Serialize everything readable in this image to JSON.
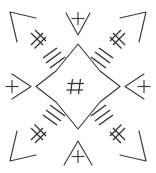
{
  "figure": {
    "width": 156,
    "height": 173,
    "background_color": "#ffffff",
    "ink_color": "#3a3a3f",
    "symmetry": "4-fold radial with diagonal and axial arms"
  },
  "center": {
    "name": "center-hash-in-star",
    "glyph": "#",
    "glyph_name": "hash-glyph",
    "enclosure": "concave-four-point-star",
    "cx": 78,
    "cy": 86.5,
    "star_point_radius": 42,
    "star_waist_radius": 26
  },
  "axial_arms": [
    {
      "name": "arm-top",
      "direction": "up",
      "chevron": "v-chevron-down",
      "glyph": "+",
      "glyph_name": "plus-glyph",
      "angle_deg": 270
    },
    {
      "name": "arm-right",
      "direction": "right",
      "chevron": "v-chevron-left",
      "glyph": "+",
      "glyph_name": "plus-glyph",
      "angle_deg": 0
    },
    {
      "name": "arm-bottom",
      "direction": "down",
      "chevron": "v-chevron-up",
      "glyph": "+",
      "glyph_name": "plus-glyph",
      "angle_deg": 90
    },
    {
      "name": "arm-left",
      "direction": "left",
      "chevron": "v-chevron-right",
      "glyph": "+",
      "glyph_name": "plus-glyph",
      "angle_deg": 180
    }
  ],
  "diagonal_arms": [
    {
      "name": "arm-top-left",
      "direction": "up-left",
      "corner_shape": "acute-arrowhead",
      "glyph": "rotated-hash",
      "glyph_name": "rotated-hash-glyph",
      "hatch_count": 3,
      "angle_deg": 225
    },
    {
      "name": "arm-top-right",
      "direction": "up-right",
      "corner_shape": "acute-arrowhead",
      "glyph": "rotated-hash",
      "glyph_name": "rotated-hash-glyph",
      "hatch_count": 3,
      "angle_deg": 315
    },
    {
      "name": "arm-bottom-right",
      "direction": "down-right",
      "corner_shape": "acute-arrowhead",
      "glyph": "rotated-hash",
      "glyph_name": "rotated-hash-glyph",
      "hatch_count": 3,
      "angle_deg": 45
    },
    {
      "name": "arm-bottom-left",
      "direction": "down-left",
      "corner_shape": "acute-arrowhead",
      "glyph": "rotated-hash",
      "glyph_name": "rotated-hash-glyph",
      "hatch_count": 3,
      "angle_deg": 135
    }
  ],
  "legend": {
    "plus_count": 4,
    "rotated_hash_count": 4,
    "hatch_group_count": 4,
    "arrowhead_count": 4,
    "center_hash_count": 1
  }
}
